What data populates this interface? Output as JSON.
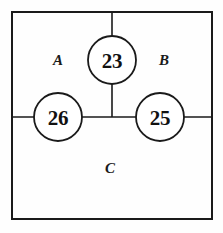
{
  "diagram": {
    "type": "region-partition-with-nodes",
    "title": "",
    "canvas": {
      "width": 223,
      "height": 233
    },
    "colors": {
      "background": "#fefefe",
      "stroke": "#1a1a1a",
      "circle_fill": "#ffffff",
      "text": "#111111"
    },
    "frame": {
      "name": "outer-rectangle",
      "x": 12,
      "y": 12,
      "width": 200,
      "height": 207,
      "stroke_width": 2
    },
    "dividers": [
      {
        "name": "horizontal-divider",
        "orientation": "horizontal",
        "x1": 12,
        "y1": 117,
        "x2": 212,
        "y2": 117,
        "stroke_width": 1.6
      },
      {
        "name": "vertical-divider",
        "orientation": "vertical",
        "x1": 112,
        "y1": 12,
        "x2": 112,
        "y2": 117,
        "stroke_width": 1.6
      }
    ],
    "regions": [
      {
        "id": "A",
        "label": "A",
        "cx": 58,
        "cy": 60,
        "description": "upper-left region"
      },
      {
        "id": "B",
        "label": "B",
        "cx": 164,
        "cy": 60,
        "description": "upper-right region"
      },
      {
        "id": "C",
        "label": "C",
        "cx": 110,
        "cy": 168,
        "description": "lower region"
      }
    ],
    "nodes": [
      {
        "id": "node-23",
        "value": "23",
        "cx": 112,
        "cy": 60,
        "r": 24,
        "on_divider": "vertical-divider"
      },
      {
        "id": "node-26",
        "value": "26",
        "cx": 58,
        "cy": 117,
        "r": 24,
        "on_divider": "horizontal-divider"
      },
      {
        "id": "node-25",
        "value": "25",
        "cx": 160,
        "cy": 117,
        "r": 24,
        "on_divider": "horizontal-divider"
      }
    ]
  }
}
